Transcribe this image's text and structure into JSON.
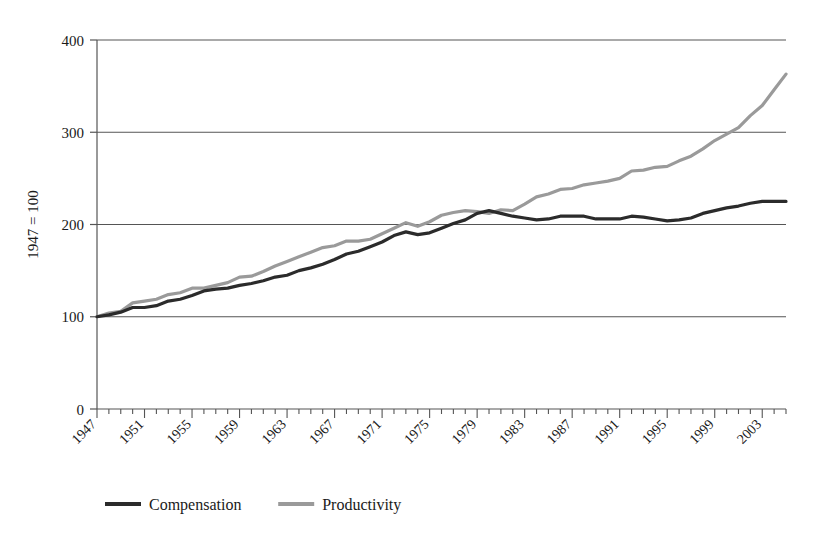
{
  "chart_data": {
    "type": "line",
    "title": "",
    "xlabel": "",
    "ylabel": "1947 = 100",
    "xlim": [
      1947,
      2005
    ],
    "ylim": [
      0,
      400
    ],
    "yticks": [
      0,
      100,
      200,
      300,
      400
    ],
    "ytick_labels": [
      "0",
      "100",
      "200",
      "300",
      "400"
    ],
    "xticks": [
      1947,
      1951,
      1955,
      1959,
      1963,
      1967,
      1971,
      1975,
      1979,
      1983,
      1987,
      1991,
      1995,
      1999,
      2003
    ],
    "xtick_labels": [
      "1947",
      "1951",
      "1955",
      "1959",
      "1963",
      "1967",
      "1971",
      "1975",
      "1979",
      "1983",
      "1987",
      "1991",
      "1995",
      "1999",
      "2003"
    ],
    "minor_xtick_step": 1,
    "grid": "horizontal",
    "legend_position": "bottom",
    "x": [
      1947,
      1948,
      1949,
      1950,
      1951,
      1952,
      1953,
      1954,
      1955,
      1956,
      1957,
      1958,
      1959,
      1960,
      1961,
      1962,
      1963,
      1964,
      1965,
      1966,
      1967,
      1968,
      1969,
      1970,
      1971,
      1972,
      1973,
      1974,
      1975,
      1976,
      1977,
      1978,
      1979,
      1980,
      1981,
      1982,
      1983,
      1984,
      1985,
      1986,
      1987,
      1988,
      1989,
      1990,
      1991,
      1992,
      1993,
      1994,
      1995,
      1996,
      1997,
      1998,
      1999,
      2000,
      2001,
      2002,
      2003,
      2004,
      2005
    ],
    "series": [
      {
        "name": "Compensation",
        "color": "#2b2b2b",
        "values": [
          100,
          102,
          105,
          110,
          110,
          112,
          117,
          119,
          123,
          128,
          130,
          131,
          134,
          136,
          139,
          143,
          145,
          150,
          153,
          157,
          162,
          168,
          171,
          176,
          181,
          188,
          192,
          189,
          191,
          196,
          201,
          205,
          212,
          215,
          212,
          209,
          207,
          205,
          206,
          209,
          209,
          209,
          206,
          206,
          206,
          209,
          208,
          206,
          204,
          205,
          207,
          212,
          215,
          218,
          220,
          223,
          225,
          225,
          225
        ]
      },
      {
        "name": "Productivity",
        "color": "#9a9a9a",
        "values": [
          100,
          104,
          106,
          115,
          117,
          119,
          124,
          126,
          131,
          131,
          134,
          137,
          143,
          144,
          149,
          155,
          160,
          165,
          170,
          175,
          177,
          182,
          182,
          184,
          190,
          196,
          202,
          198,
          203,
          210,
          213,
          215,
          214,
          212,
          216,
          215,
          222,
          230,
          233,
          238,
          239,
          243,
          245,
          247,
          250,
          258,
          259,
          262,
          263,
          269,
          274,
          282,
          291,
          298,
          305,
          318,
          329,
          346,
          363
        ]
      }
    ],
    "annotations": []
  },
  "legend": {
    "items": [
      {
        "label": "Compensation",
        "color": "#2b2b2b"
      },
      {
        "label": "Productivity",
        "color": "#9a9a9a"
      }
    ]
  }
}
